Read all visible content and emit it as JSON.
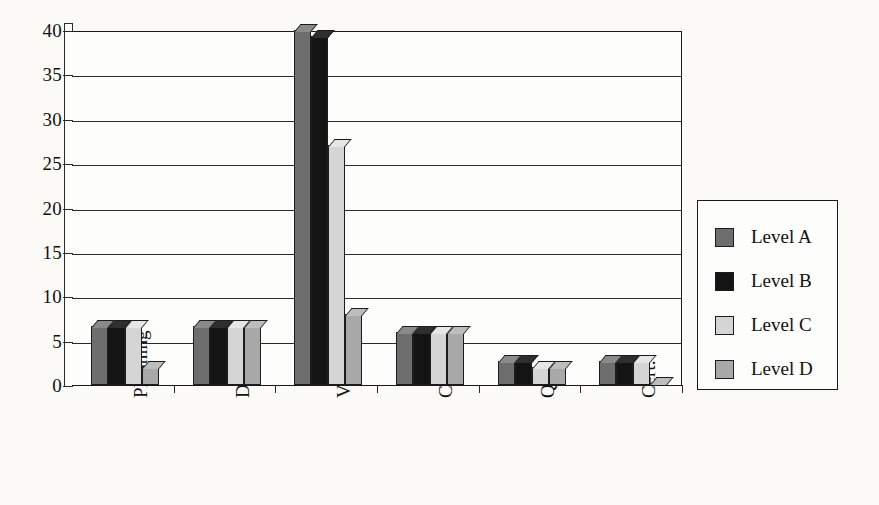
{
  "chart_data": {
    "type": "bar",
    "title": "",
    "subtitle": "",
    "xlabel": "",
    "ylabel": "",
    "categories": [
      "Planning",
      "Dvlpmt",
      "Verif.",
      "CM",
      "QA",
      "Cert."
    ],
    "series": [
      {
        "name": "Level A",
        "color": "#6e6e6e",
        "values": [
          6.7,
          6.7,
          40,
          6,
          2.7,
          2.7
        ]
      },
      {
        "name": "Level B",
        "color": "#141414",
        "values": [
          6.7,
          6.7,
          39.3,
          6,
          2.7,
          2.7
        ]
      },
      {
        "name": "Level C",
        "color": "#d5d5d5",
        "values": [
          6.7,
          6.7,
          27,
          6,
          2,
          2.7
        ]
      },
      {
        "name": "Level D",
        "color": "#a8a8a8",
        "values": [
          2,
          6.7,
          8,
          6,
          2,
          0.2
        ]
      }
    ],
    "ylim": [
      0,
      40
    ],
    "yticks": [
      0,
      5,
      10,
      15,
      20,
      25,
      30,
      35,
      40
    ],
    "ytick_labels": [
      "0",
      "5",
      "10",
      "15",
      "20",
      "25",
      "30",
      "35",
      "40"
    ],
    "grid": true,
    "grid_axis": "y",
    "legend_position": "right",
    "legend_entries": [
      "Level A",
      "Level B",
      "Level C",
      "Level D"
    ],
    "style": "3d-bar",
    "background_color": "#fbfaf6",
    "axis_color": "#1a1a1a"
  }
}
